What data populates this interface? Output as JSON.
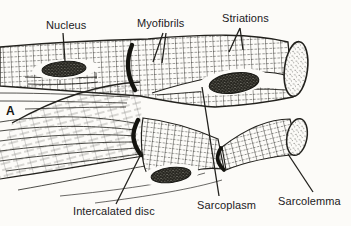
{
  "panel": {
    "letter": "A"
  },
  "labels": {
    "nucleus": "Nucleus",
    "myofibrils": "Myofibrils",
    "striations": "Striations",
    "intercalated_disc": "Intercalated disc",
    "sarcoplasm": "Sarcoplasm",
    "sarcolemma": "Sarcolemma"
  },
  "colors": {
    "paper": "#fcfbf8",
    "ink": "#22211d"
  }
}
